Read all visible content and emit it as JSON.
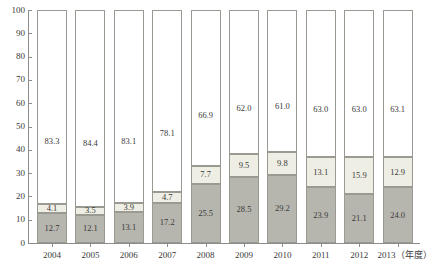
{
  "chart_data": {
    "type": "bar",
    "title": "",
    "subtitle": "",
    "xlabel": "",
    "ylabel": "",
    "stacked": true,
    "normalized_percent": true,
    "grid": false,
    "legend_position": "none",
    "ylim": [
      0,
      100
    ],
    "ytick_labels": [
      "0",
      "10",
      "20",
      "30",
      "40",
      "50",
      "60",
      "70",
      "80",
      "90",
      "100"
    ],
    "ytick_values": [
      0,
      10,
      20,
      30,
      40,
      50,
      60,
      70,
      80,
      90,
      100
    ],
    "categories": [
      "2004",
      "2005",
      "2006",
      "2007",
      "2008",
      "2009",
      "2010",
      "2011",
      "2012",
      "2013"
    ],
    "xtick_labels": [
      "2004",
      "2005",
      "2006",
      "2007",
      "2008",
      "2009",
      "2010",
      "2011",
      "2012",
      "2013（年度）"
    ],
    "series": [
      {
        "name": "bottom",
        "color": "#b6b6ae",
        "values": [
          12.7,
          12.1,
          13.1,
          17.2,
          25.5,
          28.5,
          29.2,
          23.9,
          21.1,
          24.0
        ],
        "labels": [
          "12.7",
          "12.1",
          "13.1",
          "17.2",
          "25.5",
          "28.5",
          "29.2",
          "23.9",
          "21.1",
          "24.0"
        ]
      },
      {
        "name": "middle",
        "color": "#eeeee4",
        "values": [
          4.1,
          3.5,
          3.9,
          4.7,
          7.7,
          9.5,
          9.8,
          13.1,
          15.9,
          12.9
        ],
        "labels": [
          "4.1",
          "3.5",
          "3.9",
          "4.7",
          "7.7",
          "9.5",
          "9.8",
          "13.1",
          "15.9",
          "12.9"
        ]
      },
      {
        "name": "top",
        "color": "#ffffff",
        "values": [
          83.3,
          84.4,
          83.1,
          78.1,
          66.9,
          62.0,
          61.0,
          63.0,
          63.0,
          63.1
        ],
        "labels": [
          "83.3",
          "84.4",
          "83.1",
          "78.1",
          "66.9",
          "62.0",
          "61.0",
          "63.0",
          "63.0",
          "63.1"
        ]
      }
    ]
  }
}
